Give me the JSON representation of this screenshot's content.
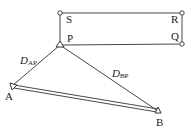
{
  "diagram": {
    "type": "survey-geometry",
    "colors": {
      "stroke": "#333333",
      "text": "#222222",
      "background": "#ffffff"
    },
    "rectangle": {
      "corners": {
        "S": {
          "label": "S",
          "x": 60,
          "y": 13,
          "marker": "circle"
        },
        "R": {
          "label": "R",
          "x": 182,
          "y": 13,
          "marker": "circle"
        },
        "Q": {
          "label": "Q",
          "x": 182,
          "y": 44,
          "marker": "circle"
        },
        "P": {
          "label": "P",
          "x": 60,
          "y": 45,
          "marker": "triangle"
        }
      }
    },
    "stations": {
      "A": {
        "label": "A",
        "x": 12,
        "y": 86,
        "marker": "triangle"
      },
      "B": {
        "label": "B",
        "x": 158,
        "y": 111,
        "marker": "triangle"
      }
    },
    "distances": {
      "AP": {
        "main": "D",
        "sub": "AP"
      },
      "BP": {
        "main": "D",
        "sub": "BP"
      }
    },
    "baseline": {
      "from": "A",
      "to": "B",
      "style": "double-line"
    }
  }
}
